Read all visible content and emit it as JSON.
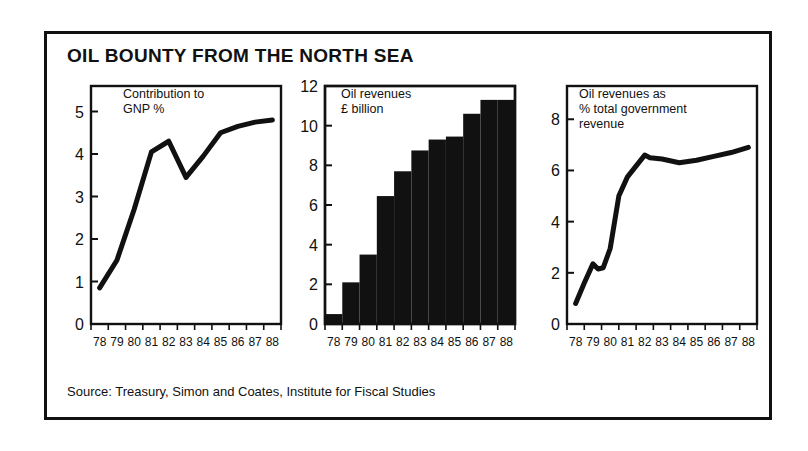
{
  "figure": {
    "title": "OIL BOUNTY FROM THE NORTH SEA",
    "source": "Source: Treasury, Simon and Coates, Institute for Fiscal Studies",
    "ink_color": "#111111",
    "background_color": "#ffffff"
  },
  "chart_data": [
    {
      "type": "line",
      "title": "Contribution to\nGNP %",
      "xlabel": "",
      "ylabel": "",
      "grid": false,
      "legend": "none",
      "categories": [
        "78",
        "79",
        "80",
        "81",
        "82",
        "83",
        "84",
        "85",
        "86",
        "87",
        "88"
      ],
      "x": [
        78,
        79,
        80,
        81,
        82,
        83,
        84,
        85,
        86,
        87,
        88
      ],
      "values": [
        0.85,
        1.5,
        2.7,
        4.05,
        4.3,
        3.45,
        3.95,
        4.5,
        4.65,
        4.75,
        4.8
      ],
      "xlim": [
        78,
        88
      ],
      "ylim": [
        0,
        5.6
      ],
      "yticks": [
        0,
        1,
        2,
        3,
        4,
        5
      ],
      "ytick_labels": [
        "0",
        "1",
        "2",
        "3",
        "4",
        "5"
      ]
    },
    {
      "type": "bar",
      "title": "Oil revenues\n£ billion",
      "xlabel": "",
      "ylabel": "",
      "grid": false,
      "legend": "none",
      "categories": [
        "78",
        "79",
        "80",
        "81",
        "82",
        "83",
        "84",
        "85",
        "86",
        "87",
        "88"
      ],
      "values": [
        0.5,
        2.1,
        3.5,
        6.45,
        7.7,
        8.75,
        9.3,
        9.45,
        10.6,
        11.3,
        11.3
      ],
      "xlim": [
        78,
        88
      ],
      "ylim": [
        0,
        12
      ],
      "yticks": [
        0,
        2,
        4,
        6,
        8,
        10,
        12
      ],
      "ytick_labels": [
        "0",
        "2",
        "4",
        "6",
        "8",
        "10",
        "12"
      ],
      "bar_color": "#111111"
    },
    {
      "type": "line",
      "title": "Oil revenues as\n% total government\nrevenue",
      "xlabel": "",
      "ylabel": "",
      "grid": false,
      "legend": "none",
      "categories": [
        "78",
        "79",
        "80",
        "81",
        "82",
        "83",
        "84",
        "85",
        "86",
        "87",
        "88"
      ],
      "x": [
        78,
        78.5,
        79,
        79.3,
        79.6,
        80,
        80.5,
        81,
        82,
        82.3,
        83,
        84,
        85,
        86,
        87,
        88
      ],
      "values": [
        0.8,
        1.6,
        2.35,
        2.15,
        2.2,
        2.95,
        5.0,
        5.75,
        6.6,
        6.5,
        6.45,
        6.3,
        6.4,
        6.55,
        6.7,
        6.9
      ],
      "xlim": [
        78,
        88
      ],
      "ylim": [
        0,
        9.3
      ],
      "yticks": [
        0,
        2,
        4,
        6,
        8
      ],
      "ytick_labels": [
        "0",
        "2",
        "4",
        "6",
        "8"
      ]
    }
  ]
}
